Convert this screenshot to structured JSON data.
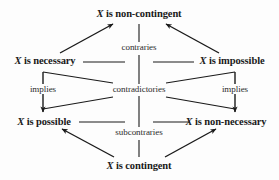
{
  "diagram": {
    "variable": "X",
    "nodes": [
      {
        "id": "non-contingent",
        "prefix": "X",
        "text": " is non-contingent",
        "full": "X is non-contingent",
        "position": "top",
        "x": 139,
        "y": 14
      },
      {
        "id": "necessary",
        "prefix": "X",
        "text": " is necessary",
        "full": "X is necessary",
        "position": "upper-left",
        "x": 47,
        "y": 59
      },
      {
        "id": "impossible",
        "prefix": "X",
        "text": " is impossible",
        "full": "X is impossible",
        "position": "upper-right",
        "x": 231,
        "y": 59
      },
      {
        "id": "possible",
        "prefix": "X",
        "text": " is possible",
        "full": "X is possible",
        "position": "lower-left",
        "x": 45,
        "y": 122
      },
      {
        "id": "non-necessary",
        "prefix": "X",
        "text": " is non-necessary",
        "full": "X is non-necessary",
        "position": "lower-right",
        "x": 226,
        "y": 122
      },
      {
        "id": "contingent",
        "prefix": "X",
        "text": " is contingent",
        "full": "X is contingent",
        "position": "bottom",
        "x": 139,
        "y": 166
      }
    ],
    "relations": [
      {
        "id": "contraries",
        "label": "contraries",
        "x": 139,
        "y": 48,
        "between": [
          "necessary",
          "impossible"
        ]
      },
      {
        "id": "contradictories",
        "label": "contradictories",
        "x": 139,
        "y": 90,
        "between": [
          "necessary",
          "non-necessary",
          "impossible",
          "possible"
        ]
      },
      {
        "id": "subcontraries",
        "label": "subcontraries",
        "x": 139,
        "y": 133,
        "between": [
          "possible",
          "non-necessary"
        ]
      },
      {
        "id": "implies-left",
        "label": "implies",
        "x": 43,
        "y": 90,
        "between": [
          "necessary",
          "possible"
        ]
      },
      {
        "id": "implies-right",
        "label": "implies",
        "x": 234,
        "y": 90,
        "between": [
          "impossible",
          "non-necessary"
        ]
      }
    ],
    "colors": {
      "line": "#1a1a1a",
      "text": "#1a1a1a",
      "background": "#fdfdfd"
    }
  }
}
